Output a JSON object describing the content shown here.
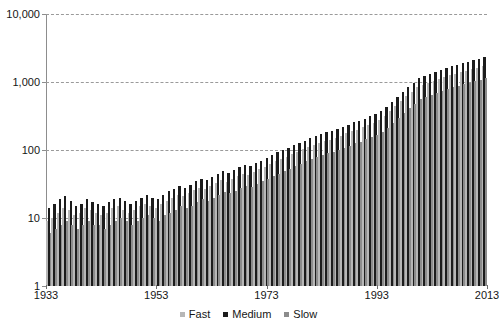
{
  "chart_data": {
    "type": "bar",
    "title": "",
    "subtitle": "",
    "xlabel": "",
    "ylabel": "",
    "yscale": "log",
    "ylim": [
      1,
      10000
    ],
    "xlim": [
      1933,
      2013
    ],
    "grid": true,
    "legend_position": "bottom",
    "y_ticks": [
      {
        "value": 1,
        "label": "1"
      },
      {
        "value": 10,
        "label": "10"
      },
      {
        "value": 100,
        "label": "100"
      },
      {
        "value": 1000,
        "label": "1,000"
      },
      {
        "value": 10000,
        "label": "10,000"
      }
    ],
    "x_ticks": [
      {
        "value": 1933,
        "label": "1933"
      },
      {
        "value": 1953,
        "label": "1953"
      },
      {
        "value": 1973,
        "label": "1973"
      },
      {
        "value": 1993,
        "label": "1993"
      },
      {
        "value": 2013,
        "label": "2013"
      }
    ],
    "x": [
      1933,
      1934,
      1935,
      1936,
      1937,
      1938,
      1939,
      1940,
      1941,
      1942,
      1943,
      1944,
      1945,
      1946,
      1947,
      1948,
      1949,
      1950,
      1951,
      1952,
      1953,
      1954,
      1955,
      1956,
      1957,
      1958,
      1959,
      1960,
      1961,
      1962,
      1963,
      1964,
      1965,
      1966,
      1967,
      1968,
      1969,
      1970,
      1971,
      1972,
      1973,
      1974,
      1975,
      1976,
      1977,
      1978,
      1979,
      1980,
      1981,
      1982,
      1983,
      1984,
      1985,
      1986,
      1987,
      1988,
      1989,
      1990,
      1991,
      1992,
      1993,
      1994,
      1995,
      1996,
      1997,
      1998,
      1999,
      2000,
      2001,
      2002,
      2003,
      2004,
      2005,
      2006,
      2007,
      2008,
      2009,
      2010,
      2011,
      2012,
      2013
    ],
    "colors": {
      "fast": "#b7b7b7",
      "medium": "#1c1c1c",
      "slow": "#8c8c8c"
    },
    "series": [
      {
        "name": "Fast",
        "color": "#b7b7b7",
        "values": [
          9,
          10,
          12,
          14,
          13,
          11,
          12,
          14,
          13,
          12,
          11,
          12,
          14,
          15,
          13,
          12,
          13,
          15,
          16,
          15,
          14,
          16,
          18,
          20,
          22,
          21,
          23,
          26,
          28,
          27,
          30,
          33,
          36,
          34,
          38,
          42,
          45,
          43,
          48,
          52,
          57,
          62,
          68,
          74,
          80,
          88,
          95,
          102,
          110,
          118,
          126,
          134,
          142,
          150,
          162,
          175,
          188,
          200,
          215,
          232,
          250,
          280,
          320,
          380,
          450,
          530,
          620,
          720,
          840,
          900,
          980,
          1050,
          1120,
          1190,
          1260,
          1330,
          1400,
          1470,
          1540,
          1620,
          1700
        ]
      },
      {
        "name": "Medium",
        "color": "#1c1c1c",
        "values": [
          14,
          16,
          19,
          21,
          18,
          15,
          16,
          19,
          17,
          16,
          15,
          17,
          19,
          20,
          18,
          16,
          18,
          20,
          22,
          20,
          19,
          22,
          25,
          27,
          30,
          28,
          31,
          35,
          38,
          36,
          40,
          45,
          49,
          46,
          51,
          57,
          61,
          58,
          65,
          70,
          77,
          84,
          92,
          100,
          108,
          119,
          128,
          138,
          149,
          160,
          170,
          181,
          192,
          203,
          219,
          236,
          254,
          270,
          290,
          313,
          337,
          378,
          432,
          513,
          607,
          715,
          837,
          972,
          1134,
          1215,
          1323,
          1418,
          1512,
          1606,
          1701,
          1795,
          1890,
          1984,
          2079,
          2187,
          2295
        ]
      },
      {
        "name": "Slow",
        "color": "#8c8c8c",
        "values": [
          6,
          7,
          8,
          9,
          8,
          7,
          8,
          9,
          8,
          8,
          7,
          8,
          9,
          10,
          9,
          8,
          9,
          10,
          11,
          10,
          9,
          11,
          12,
          13,
          15,
          14,
          15,
          17,
          19,
          18,
          20,
          22,
          24,
          23,
          25,
          28,
          30,
          29,
          32,
          35,
          38,
          41,
          45,
          49,
          53,
          58,
          63,
          68,
          73,
          78,
          84,
          89,
          94,
          100,
          108,
          116,
          125,
          133,
          143,
          154,
          166,
          186,
          213,
          252,
          299,
          352,
          412,
          478,
          558,
          598,
          651,
          698,
          744,
          790,
          837,
          883,
          930,
          976,
          1023,
          1076,
          1129
        ]
      }
    ]
  },
  "legend": {
    "items": [
      {
        "label": "Fast",
        "color": "#b7b7b7"
      },
      {
        "label": "Medium",
        "color": "#1c1c1c"
      },
      {
        "label": "Slow",
        "color": "#8c8c8c"
      }
    ]
  }
}
